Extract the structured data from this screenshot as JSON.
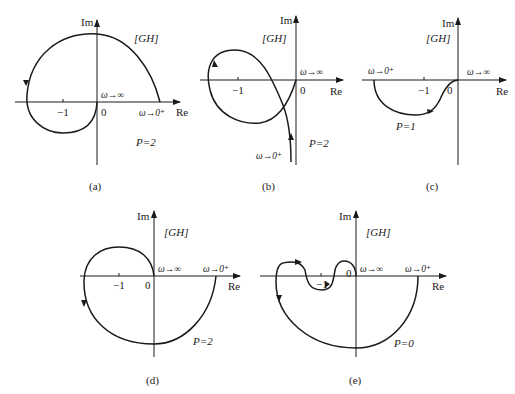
{
  "figure": {
    "panels": [
      {
        "id": "a",
        "caption": "(a)",
        "im_label": "Im",
        "re_label": "Re",
        "gh_label": "[GH]",
        "minus_one": "−1",
        "zero": "0",
        "w_inf": "ω→∞",
        "w_zero": "ω→0⁺",
        "p_label": "P=2"
      },
      {
        "id": "b",
        "caption": "(b)",
        "im_label": "Im",
        "re_label": "Re",
        "gh_label": "[GH]",
        "minus_one": "−1",
        "zero": "0",
        "w_inf": "ω→∞",
        "w_zero": "ω→0⁺",
        "p_label": "P=2"
      },
      {
        "id": "c",
        "caption": "(c)",
        "im_label": "Im",
        "re_label": "Re",
        "gh_label": "[GH]",
        "minus_one": "−1",
        "zero": "0",
        "w_inf": "ω→∞",
        "w_zero": "ω→0⁺",
        "p_label": "P=1"
      },
      {
        "id": "d",
        "caption": "(d)",
        "im_label": "Im",
        "re_label": "Re",
        "gh_label": "[GH]",
        "minus_one": "−1",
        "zero": "0",
        "w_inf": "ω→∞",
        "w_zero": "ω→0⁺",
        "p_label": "P=2"
      },
      {
        "id": "e",
        "caption": "(e)",
        "im_label": "Im",
        "re_label": "Re",
        "gh_label": "[GH]",
        "minus_one": "−1",
        "zero": "0",
        "w_inf": "ω→∞",
        "w_zero": "ω→0⁺",
        "p_label": "P=0"
      }
    ]
  }
}
